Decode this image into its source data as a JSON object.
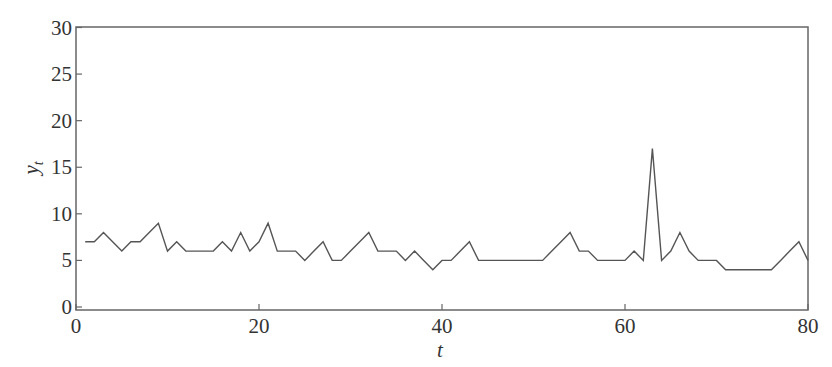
{
  "chart_data": {
    "type": "line",
    "title": "",
    "xlabel": "t",
    "ylabel": "y_t",
    "xlim": [
      0,
      80
    ],
    "ylim": [
      0,
      30
    ],
    "xticks": [
      0,
      20,
      40,
      60,
      80
    ],
    "yticks": [
      0,
      5,
      10,
      15,
      20,
      25,
      30
    ],
    "grid": false,
    "legend": null,
    "series": [
      {
        "name": "y_t",
        "color": "#555555",
        "x": [
          1,
          2,
          3,
          4,
          5,
          6,
          7,
          8,
          9,
          10,
          11,
          12,
          13,
          14,
          15,
          16,
          17,
          18,
          19,
          20,
          21,
          22,
          23,
          24,
          25,
          26,
          27,
          28,
          29,
          30,
          31,
          32,
          33,
          34,
          35,
          36,
          37,
          38,
          39,
          40,
          41,
          42,
          43,
          44,
          45,
          46,
          47,
          48,
          49,
          50,
          51,
          52,
          53,
          54,
          55,
          56,
          57,
          58,
          59,
          60,
          61,
          62,
          63,
          64,
          65,
          66,
          67,
          68,
          69,
          70,
          71,
          72,
          73,
          74,
          75,
          76,
          77,
          78,
          79,
          80
        ],
        "values": [
          7,
          7,
          8,
          7,
          6,
          7,
          7,
          8,
          9,
          6,
          7,
          6,
          6,
          6,
          6,
          7,
          6,
          8,
          6,
          7,
          9,
          6,
          6,
          6,
          5,
          6,
          7,
          5,
          5,
          6,
          7,
          8,
          6,
          6,
          6,
          5,
          6,
          5,
          4,
          5,
          5,
          6,
          7,
          5,
          5,
          5,
          5,
          5,
          5,
          5,
          5,
          6,
          7,
          8,
          6,
          6,
          5,
          5,
          5,
          5,
          6,
          5,
          17,
          5,
          6,
          8,
          6,
          5,
          5,
          5,
          4,
          4,
          4,
          4,
          4,
          4,
          5,
          6,
          7,
          5
        ]
      }
    ]
  },
  "labels": {
    "xlabel": "t",
    "ylabel_main": "y",
    "ylabel_sub": "t",
    "xtick_labels": [
      "0",
      "20",
      "40",
      "60",
      "80"
    ],
    "ytick_labels": [
      "0",
      "5",
      "10",
      "15",
      "20",
      "25",
      "30"
    ]
  },
  "colors": {
    "frame": "#666666",
    "line": "#555555",
    "text": "#333333"
  }
}
